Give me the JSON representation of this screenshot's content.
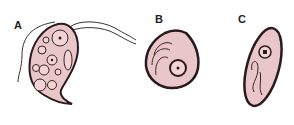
{
  "figure": {
    "panels": [
      {
        "label": "A",
        "description": "flagellated trophozoite with cytoplasmic vacuoles"
      },
      {
        "label": "B",
        "description": "rounded cyst with nucleus"
      },
      {
        "label": "C",
        "description": "elongated oval cyst with nucleus"
      }
    ],
    "colors": {
      "cell_fill": "#e9c6c9",
      "outline": "#2a1a1c",
      "vacuole": "#f2d3d6"
    }
  }
}
